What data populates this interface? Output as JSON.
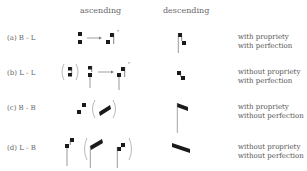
{
  "header": {
    "ascending": "ascending",
    "descending": "descending"
  },
  "rows": [
    {
      "label": "(a)  B - L",
      "propriety": "with propriety",
      "perfection": "with perfection",
      "ascending_note": "two stacked square notes → ligature with right stem, marked *",
      "descending_note": "left-stemmed square descending to lower square"
    },
    {
      "label": "(b)  L - L",
      "propriety": "without propriety",
      "perfection": "with perfection",
      "ascending_note": "(bracketed variant) two longs → ligature with stems, marked *",
      "descending_note": "two squares descending without stem"
    },
    {
      "label": "(c)  B - B",
      "propriety": "with propriety",
      "perfection": "without perfection",
      "ascending_note": "two separated squares, (oblique ascending bar)",
      "descending_note": "stemmed oblique descending bar"
    },
    {
      "label": "(d)  L - B",
      "propriety": "without propriety",
      "perfection": "without perfection",
      "ascending_note": "stemmed square pair (oblique stemmed variants)",
      "descending_note": "oblique descending bar without stem"
    }
  ],
  "colors": {
    "ink": "#1a1a1a",
    "text": "#555555"
  }
}
